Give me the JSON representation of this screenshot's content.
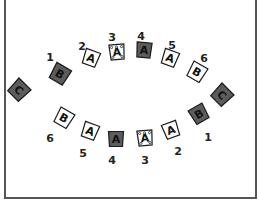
{
  "diagram": {
    "type": "seating-layout",
    "colors": {
      "dark_fill": "#5c5c5c",
      "light_fill": "#ffffff",
      "stroke": "#1a1a1a",
      "dark_letter": "#111111",
      "light_letter": "#111111"
    },
    "top_row": [
      {
        "id": "top-c-left",
        "letter": "C",
        "number": "",
        "style": "dark",
        "x": 19,
        "y": 90,
        "size": 17,
        "rotate": 45
      },
      {
        "id": "top-1",
        "letter": "B",
        "number": "1",
        "style": "dark",
        "x": 60,
        "y": 74,
        "size": 17,
        "rotate": 30
      },
      {
        "id": "top-2",
        "letter": "A",
        "number": "2",
        "style": "light",
        "x": 91,
        "y": 58,
        "size": 15,
        "rotate": 20
      },
      {
        "id": "top-3",
        "letter": "A",
        "number": "3",
        "style": "light-dotted",
        "x": 117,
        "y": 52,
        "size": 15,
        "rotate": -5
      },
      {
        "id": "top-4",
        "letter": "A",
        "number": "4",
        "style": "dark",
        "x": 144,
        "y": 50,
        "size": 15,
        "rotate": 5
      },
      {
        "id": "top-5",
        "letter": "A",
        "number": "5",
        "style": "light",
        "x": 170,
        "y": 58,
        "size": 15,
        "rotate": 20
      },
      {
        "id": "top-6",
        "letter": "B",
        "number": "6",
        "style": "light",
        "x": 197,
        "y": 72,
        "size": 16,
        "rotate": 30
      },
      {
        "id": "top-c-right",
        "letter": "C",
        "number": "",
        "style": "dark",
        "x": 222,
        "y": 95,
        "size": 17,
        "rotate": 45
      }
    ],
    "bottom_row": [
      {
        "id": "bottom-6",
        "letter": "B",
        "number": "6",
        "style": "light",
        "x": 64,
        "y": 118,
        "size": 16,
        "rotate": 30
      },
      {
        "id": "bottom-5",
        "letter": "A",
        "number": "5",
        "style": "light",
        "x": 90,
        "y": 131,
        "size": 15,
        "rotate": 20
      },
      {
        "id": "bottom-4",
        "letter": "A",
        "number": "4",
        "style": "dark",
        "x": 116,
        "y": 139,
        "size": 15,
        "rotate": 0
      },
      {
        "id": "bottom-3",
        "letter": "A",
        "number": "3",
        "style": "light-dotted",
        "x": 145,
        "y": 138,
        "size": 15,
        "rotate": -5
      },
      {
        "id": "bottom-2",
        "letter": "A",
        "number": "2",
        "style": "light",
        "x": 171,
        "y": 130,
        "size": 15,
        "rotate": -20
      },
      {
        "id": "bottom-1",
        "letter": "B",
        "number": "1",
        "style": "dark",
        "x": 199,
        "y": 114,
        "size": 16,
        "rotate": -30
      }
    ],
    "labels_top": [
      {
        "text": "1",
        "x": 50,
        "y": 57
      },
      {
        "text": "2",
        "x": 82,
        "y": 46
      },
      {
        "text": "3",
        "x": 112,
        "y": 37
      },
      {
        "text": "4",
        "x": 141,
        "y": 36
      },
      {
        "text": "5",
        "x": 172,
        "y": 45
      },
      {
        "text": "6",
        "x": 204,
        "y": 58
      }
    ],
    "labels_bottom": [
      {
        "text": "6",
        "x": 50,
        "y": 138
      },
      {
        "text": "5",
        "x": 83,
        "y": 153
      },
      {
        "text": "4",
        "x": 112,
        "y": 160
      },
      {
        "text": "3",
        "x": 145,
        "y": 160
      },
      {
        "text": "2",
        "x": 178,
        "y": 151
      },
      {
        "text": "1",
        "x": 208,
        "y": 137
      }
    ]
  }
}
